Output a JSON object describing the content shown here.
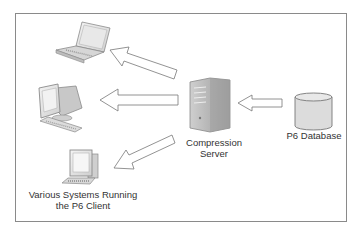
{
  "diagram": {
    "nodes": {
      "server": {
        "label_line1": "Compression",
        "label_line2": "Server",
        "icon": "server-tower-icon"
      },
      "database": {
        "label": "P6 Database",
        "icon": "database-cylinder-icon"
      },
      "clients": {
        "label_line1": "Various Systems Running",
        "label_line2": "the P6 Client",
        "items": [
          "laptop-icon",
          "crt-monitor-icon",
          "desktop-pc-icon"
        ]
      }
    },
    "edges": [
      {
        "from": "database",
        "to": "server"
      },
      {
        "from": "server",
        "to": "laptop"
      },
      {
        "from": "server",
        "to": "crt-monitor"
      },
      {
        "from": "server",
        "to": "desktop-pc"
      }
    ],
    "colors": {
      "frame": "#8a8a8a",
      "arrow_stroke": "#777777",
      "icon_gray": "#b0b0b0",
      "text": "#333333"
    }
  }
}
